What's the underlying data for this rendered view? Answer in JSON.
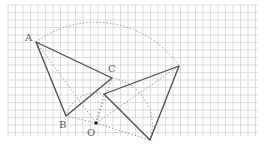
{
  "diagram": {
    "type": "geometric-rotation",
    "grid": {
      "x0": 8,
      "y0": 5,
      "x1": 258,
      "y1": 136,
      "step": 7.5,
      "color": "#c8c8c8"
    },
    "colors": {
      "solid": "#4a4a4a",
      "dotted": "#777777",
      "center": "#222222",
      "label": "#555555"
    },
    "labels": {
      "A": "A",
      "B": "B",
      "C": "C",
      "O": "O"
    },
    "points": {
      "A": [
        36,
        42
      ],
      "B": [
        66,
        116
      ],
      "C": [
        112,
        78
      ],
      "O": [
        96,
        123
      ],
      "A_prime": [
        179,
        66
      ],
      "B_prime": [
        104,
        94
      ],
      "C_prime": [
        150,
        140
      ]
    },
    "original_triangle": [
      "A",
      "B",
      "C"
    ],
    "rotated_triangle": [
      "A_prime",
      "B_prime",
      "C_prime"
    ],
    "center_of_rotation": "O"
  }
}
